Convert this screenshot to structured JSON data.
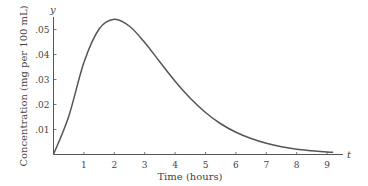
{
  "chart_data": {
    "type": "line",
    "title": "",
    "xlabel": "Time (hours)",
    "ylabel": "Concentration (mg per 100 mL)",
    "x_axis_var": "t",
    "y_axis_var": "y",
    "xlim": [
      0,
      9.2
    ],
    "ylim": [
      0,
      0.055
    ],
    "x_ticks": [
      1,
      2,
      3,
      4,
      5,
      6,
      7,
      8,
      9
    ],
    "x_tick_labels": [
      "1",
      "2",
      "3",
      "4",
      "5",
      "6",
      "7",
      "8",
      "9"
    ],
    "y_ticks": [
      0.01,
      0.02,
      0.03,
      0.04,
      0.05
    ],
    "y_tick_labels": [
      ".01",
      ".02",
      ".03",
      ".04",
      ".05"
    ],
    "grid": false,
    "legend": null,
    "series": [
      {
        "name": "Concentration",
        "x": [
          0,
          0.5,
          1,
          1.5,
          2,
          2.5,
          3,
          3.5,
          4,
          4.5,
          5,
          5.5,
          6,
          6.5,
          7,
          7.5,
          8,
          8.5,
          9,
          9.2
        ],
        "values": [
          0,
          0.0152,
          0.0368,
          0.0502,
          0.0541,
          0.0513,
          0.0448,
          0.037,
          0.0293,
          0.0225,
          0.0168,
          0.0123,
          0.0089,
          0.0064,
          0.0045,
          0.0031,
          0.0021,
          0.0015,
          0.001,
          0.0009
        ]
      }
    ],
    "colors": {
      "axis": "#555555",
      "curve": "#555555",
      "text": "#444444"
    }
  }
}
